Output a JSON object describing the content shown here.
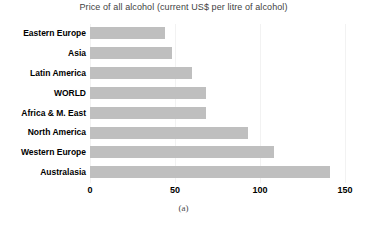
{
  "chart_data": {
    "type": "bar",
    "orientation": "horizontal",
    "title": "Price of all alcohol (current US$ per litre of alcohol)",
    "caption": "(a)",
    "xlabel": "",
    "ylabel": "",
    "categories": [
      "Eastern Europe",
      "Asia",
      "Latin America",
      "WORLD",
      "Africa & M. East",
      "North America",
      "Western Europe",
      "Australasia"
    ],
    "values": [
      44,
      48,
      60,
      68,
      68,
      93,
      108,
      141
    ],
    "series": [
      {
        "name": "Price of all alcohol",
        "values": [
          44,
          48,
          60,
          68,
          68,
          93,
          108,
          141
        ]
      }
    ],
    "xlim": [
      0,
      150
    ],
    "xticks": [
      0,
      50,
      100,
      150
    ],
    "xtick_labels": [
      "0",
      "50",
      "100",
      "150"
    ],
    "grid": true,
    "grid_axis": "x",
    "legend": false,
    "bar_color": "#bfbfbf",
    "gridline_color": "#f2f2f2",
    "title_color": "#3f3f3f",
    "label_color": "#000000"
  }
}
